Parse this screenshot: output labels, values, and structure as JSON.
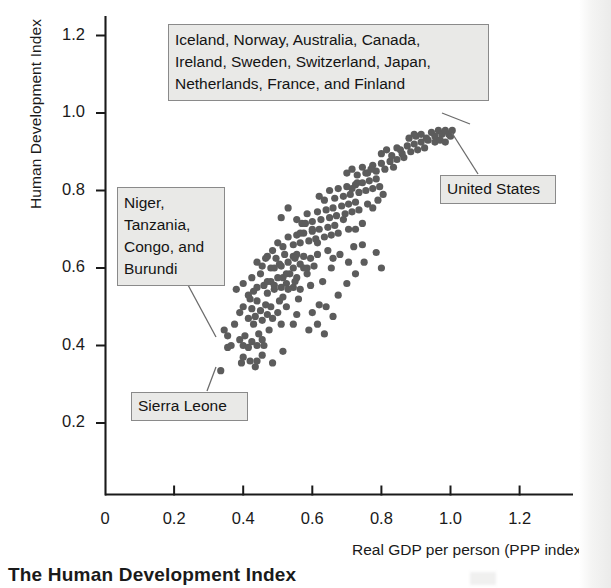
{
  "caption": "The Human Development Index",
  "chart_data": {
    "type": "scatter",
    "title": "",
    "xlabel": "Real GDP per person (PPP index)",
    "ylabel": "Human Development Index",
    "xlim": [
      0,
      1.32
    ],
    "ylim": [
      0,
      1.3
    ],
    "xticks": [
      "0",
      "0.2",
      "0.4",
      "0.6",
      "0.8",
      "1.0",
      "1.2"
    ],
    "xtick_values": [
      0,
      0.2,
      0.4,
      0.6,
      0.8,
      1.0,
      1.2
    ],
    "yticks": [
      "0.2",
      "0.4",
      "0.6",
      "0.8",
      "1.0",
      "1.2"
    ],
    "ytick_values": [
      0.2,
      0.4,
      0.6,
      0.8,
      1.0,
      1.2
    ],
    "grid": false,
    "legend": "none",
    "marker_color": "#5c5c5c",
    "marker_size": 6,
    "annotations": [
      {
        "name": "high-hdi-countries",
        "text": "Iceland, Norway, Australia, Canada,\nIreland, Sweden, Switzerland, Japan,\nNetherlands, France, and Finland",
        "points_to": [
          0.98,
          0.955
        ]
      },
      {
        "name": "low-hdi-countries",
        "text": "Niger,\nTanzania,\nCongo, and\nBurundi",
        "points_to": [
          0.355,
          0.395
        ]
      },
      {
        "name": "sierra-leone",
        "text": "Sierra Leone",
        "points_to": [
          0.345,
          0.335
        ]
      },
      {
        "name": "united-states",
        "text": "United States",
        "points_to": [
          1.0,
          0.94
        ]
      }
    ],
    "points": [
      [
        0.335,
        0.335
      ],
      [
        0.355,
        0.395
      ],
      [
        0.345,
        0.44
      ],
      [
        0.365,
        0.4
      ],
      [
        0.355,
        0.425
      ],
      [
        0.375,
        0.455
      ],
      [
        0.39,
        0.415
      ],
      [
        0.4,
        0.4
      ],
      [
        0.405,
        0.425
      ],
      [
        0.415,
        0.395
      ],
      [
        0.425,
        0.41
      ],
      [
        0.43,
        0.455
      ],
      [
        0.44,
        0.4
      ],
      [
        0.445,
        0.43
      ],
      [
        0.455,
        0.415
      ],
      [
        0.46,
        0.4
      ],
      [
        0.39,
        0.485
      ],
      [
        0.4,
        0.5
      ],
      [
        0.415,
        0.47
      ],
      [
        0.425,
        0.495
      ],
      [
        0.435,
        0.475
      ],
      [
        0.44,
        0.515
      ],
      [
        0.45,
        0.49
      ],
      [
        0.455,
        0.465
      ],
      [
        0.465,
        0.505
      ],
      [
        0.47,
        0.48
      ],
      [
        0.48,
        0.5
      ],
      [
        0.485,
        0.47
      ],
      [
        0.5,
        0.485
      ],
      [
        0.505,
        0.515
      ],
      [
        0.38,
        0.545
      ],
      [
        0.4,
        0.56
      ],
      [
        0.415,
        0.53
      ],
      [
        0.425,
        0.575
      ],
      [
        0.44,
        0.55
      ],
      [
        0.45,
        0.585
      ],
      [
        0.46,
        0.555
      ],
      [
        0.47,
        0.535
      ],
      [
        0.48,
        0.565
      ],
      [
        0.49,
        0.545
      ],
      [
        0.5,
        0.575
      ],
      [
        0.51,
        0.55
      ],
      [
        0.515,
        0.525
      ],
      [
        0.525,
        0.56
      ],
      [
        0.535,
        0.585
      ],
      [
        0.545,
        0.55
      ],
      [
        0.555,
        0.575
      ],
      [
        0.565,
        0.545
      ],
      [
        0.44,
        0.615
      ],
      [
        0.455,
        0.605
      ],
      [
        0.47,
        0.63
      ],
      [
        0.48,
        0.6
      ],
      [
        0.495,
        0.625
      ],
      [
        0.51,
        0.605
      ],
      [
        0.52,
        0.635
      ],
      [
        0.53,
        0.615
      ],
      [
        0.545,
        0.6
      ],
      [
        0.555,
        0.635
      ],
      [
        0.565,
        0.61
      ],
      [
        0.575,
        0.63
      ],
      [
        0.585,
        0.6
      ],
      [
        0.595,
        0.625
      ],
      [
        0.605,
        0.605
      ],
      [
        0.615,
        0.635
      ],
      [
        0.5,
        0.665
      ],
      [
        0.515,
        0.655
      ],
      [
        0.53,
        0.68
      ],
      [
        0.545,
        0.66
      ],
      [
        0.555,
        0.685
      ],
      [
        0.565,
        0.665
      ],
      [
        0.575,
        0.69
      ],
      [
        0.59,
        0.67
      ],
      [
        0.6,
        0.695
      ],
      [
        0.61,
        0.675
      ],
      [
        0.62,
        0.7
      ],
      [
        0.635,
        0.68
      ],
      [
        0.645,
        0.705
      ],
      [
        0.655,
        0.685
      ],
      [
        0.665,
        0.71
      ],
      [
        0.675,
        0.69
      ],
      [
        0.555,
        0.725
      ],
      [
        0.57,
        0.715
      ],
      [
        0.585,
        0.74
      ],
      [
        0.6,
        0.72
      ],
      [
        0.615,
        0.745
      ],
      [
        0.625,
        0.725
      ],
      [
        0.64,
        0.75
      ],
      [
        0.65,
        0.73
      ],
      [
        0.66,
        0.755
      ],
      [
        0.67,
        0.735
      ],
      [
        0.685,
        0.76
      ],
      [
        0.695,
        0.74
      ],
      [
        0.705,
        0.765
      ],
      [
        0.715,
        0.745
      ],
      [
        0.725,
        0.77
      ],
      [
        0.735,
        0.75
      ],
      [
        0.62,
        0.785
      ],
      [
        0.635,
        0.775
      ],
      [
        0.65,
        0.8
      ],
      [
        0.665,
        0.78
      ],
      [
        0.675,
        0.805
      ],
      [
        0.69,
        0.785
      ],
      [
        0.7,
        0.81
      ],
      [
        0.71,
        0.79
      ],
      [
        0.725,
        0.815
      ],
      [
        0.735,
        0.795
      ],
      [
        0.745,
        0.82
      ],
      [
        0.755,
        0.8
      ],
      [
        0.765,
        0.825
      ],
      [
        0.775,
        0.805
      ],
      [
        0.785,
        0.83
      ],
      [
        0.795,
        0.81
      ],
      [
        0.7,
        0.845
      ],
      [
        0.715,
        0.855
      ],
      [
        0.73,
        0.84
      ],
      [
        0.745,
        0.86
      ],
      [
        0.76,
        0.845
      ],
      [
        0.775,
        0.865
      ],
      [
        0.785,
        0.85
      ],
      [
        0.8,
        0.87
      ],
      [
        0.81,
        0.855
      ],
      [
        0.825,
        0.875
      ],
      [
        0.835,
        0.86
      ],
      [
        0.845,
        0.88
      ],
      [
        0.8,
        0.895
      ],
      [
        0.815,
        0.905
      ],
      [
        0.83,
        0.89
      ],
      [
        0.845,
        0.91
      ],
      [
        0.86,
        0.895
      ],
      [
        0.875,
        0.915
      ],
      [
        0.885,
        0.9
      ],
      [
        0.895,
        0.92
      ],
      [
        0.905,
        0.905
      ],
      [
        0.915,
        0.925
      ],
      [
        0.925,
        0.91
      ],
      [
        0.935,
        0.93
      ],
      [
        0.9,
        0.94
      ],
      [
        0.915,
        0.945
      ],
      [
        0.93,
        0.935
      ],
      [
        0.945,
        0.95
      ],
      [
        0.955,
        0.94
      ],
      [
        0.965,
        0.955
      ],
      [
        0.975,
        0.945
      ],
      [
        0.985,
        0.955
      ],
      [
        0.995,
        0.945
      ],
      [
        1.0,
        0.94
      ],
      [
        0.955,
        0.925
      ],
      [
        0.97,
        0.93
      ],
      [
        0.985,
        0.925
      ],
      [
        1.005,
        0.955
      ],
      [
        0.49,
        0.555
      ],
      [
        0.525,
        0.5
      ],
      [
        0.56,
        0.52
      ],
      [
        0.595,
        0.555
      ],
      [
        0.63,
        0.565
      ],
      [
        0.655,
        0.6
      ],
      [
        0.68,
        0.635
      ],
      [
        0.705,
        0.615
      ],
      [
        0.72,
        0.655
      ],
      [
        0.745,
        0.66
      ],
      [
        0.6,
        0.485
      ],
      [
        0.64,
        0.5
      ],
      [
        0.675,
        0.53
      ],
      [
        0.7,
        0.56
      ],
      [
        0.725,
        0.585
      ],
      [
        0.75,
        0.615
      ],
      [
        0.785,
        0.64
      ],
      [
        0.8,
        0.6
      ],
      [
        0.475,
        0.44
      ],
      [
        0.51,
        0.455
      ],
      [
        0.555,
        0.48
      ],
      [
        0.59,
        0.44
      ],
      [
        0.42,
        0.36
      ],
      [
        0.455,
        0.375
      ],
      [
        0.485,
        0.355
      ],
      [
        0.515,
        0.385
      ],
      [
        0.395,
        0.355
      ],
      [
        0.4,
        0.37
      ],
      [
        0.435,
        0.345
      ],
      [
        0.44,
        0.36
      ],
      [
        0.6,
        0.7
      ],
      [
        0.615,
        0.665
      ],
      [
        0.645,
        0.645
      ],
      [
        0.66,
        0.625
      ],
      [
        0.69,
        0.725
      ],
      [
        0.705,
        0.7
      ],
      [
        0.725,
        0.7
      ],
      [
        0.745,
        0.715
      ],
      [
        0.76,
        0.765
      ],
      [
        0.775,
        0.755
      ],
      [
        0.79,
        0.775
      ],
      [
        0.805,
        0.79
      ],
      [
        0.715,
        0.805
      ],
      [
        0.73,
        0.82
      ],
      [
        0.755,
        0.845
      ],
      [
        0.77,
        0.855
      ],
      [
        0.855,
        0.905
      ],
      [
        0.865,
        0.885
      ],
      [
        0.88,
        0.935
      ],
      [
        0.895,
        0.945
      ],
      [
        0.545,
        0.455
      ],
      [
        0.545,
        0.63
      ],
      [
        0.565,
        0.69
      ],
      [
        0.58,
        0.715
      ],
      [
        0.51,
        0.73
      ],
      [
        0.53,
        0.755
      ],
      [
        0.55,
        0.625
      ],
      [
        0.575,
        0.6
      ],
      [
        0.42,
        0.52
      ],
      [
        0.43,
        0.54
      ],
      [
        0.47,
        0.565
      ],
      [
        0.49,
        0.6
      ],
      [
        0.515,
        0.575
      ],
      [
        0.53,
        0.545
      ],
      [
        0.55,
        0.565
      ],
      [
        0.585,
        0.585
      ],
      [
        0.62,
        0.505
      ],
      [
        0.66,
        0.475
      ],
      [
        0.615,
        0.455
      ],
      [
        0.635,
        0.43
      ],
      [
        0.465,
        0.625
      ],
      [
        0.485,
        0.645
      ],
      [
        0.505,
        0.61
      ],
      [
        0.525,
        0.585
      ]
    ]
  },
  "point_count": 218
}
